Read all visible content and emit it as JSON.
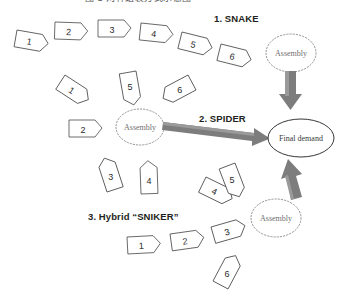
{
  "figure": {
    "title_clipped": "图 1  两种组装方式示意图",
    "width": 338,
    "height": 291,
    "background": "#ffffff"
  },
  "colors": {
    "block_stroke": "#4a4a4a",
    "block_fill": "#ffffff",
    "thick_arrow": "#7d7d7d",
    "thick_arrow_highlight": "#9a9a9a",
    "dotted_node_stroke": "#8a8a8a",
    "solid_node_stroke": "#1f1f1f",
    "label_text": "#231f20",
    "node_text": "#6f6f6f",
    "number_text": "#2b2b2b"
  },
  "groups": [
    {
      "id": "snake",
      "label": "1. SNAKE"
    },
    {
      "id": "spider",
      "label": "2. SPIDER"
    },
    {
      "id": "hybrid",
      "label": "3. Hybrid “SNIKER”"
    }
  ],
  "nodes": {
    "assembly_snake": {
      "label": "Assembly",
      "style": "dotted"
    },
    "assembly_spider": {
      "label": "Assembly",
      "style": "dotted"
    },
    "assembly_hybrid": {
      "label": "Assembly",
      "style": "dotted"
    },
    "final_demand": {
      "label": "Final demand",
      "style": "solid"
    }
  },
  "stages": {
    "snake": [
      "1",
      "2",
      "3",
      "4",
      "5",
      "6"
    ],
    "spider": [
      "1",
      "2",
      "3",
      "4",
      "5",
      "6"
    ],
    "hybrid": [
      "1",
      "2",
      "3",
      "4",
      "5",
      "6"
    ]
  },
  "flows": [
    {
      "from": "assembly_snake",
      "to": "final_demand",
      "direction": "down"
    },
    {
      "from": "assembly_spider",
      "to": "final_demand",
      "direction": "right"
    },
    {
      "from": "assembly_hybrid",
      "to": "final_demand",
      "direction": "up"
    }
  ]
}
